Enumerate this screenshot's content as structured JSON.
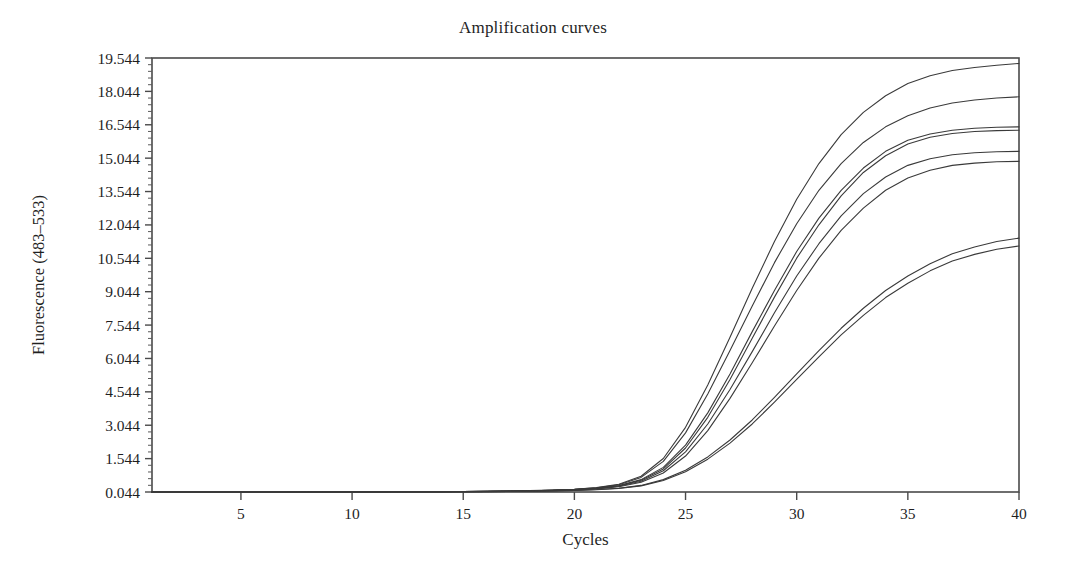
{
  "chart_data": {
    "type": "line",
    "title": "Amplification curves",
    "xlabel": "Cycles",
    "ylabel": "Fluorescence (483–533)",
    "xlim": [
      1,
      40
    ],
    "ylim": [
      0.044,
      19.544
    ],
    "grid": false,
    "legend": null,
    "xticks": [
      5,
      10,
      15,
      20,
      25,
      30,
      35,
      40
    ],
    "xtick_labels": [
      "5",
      "10",
      "15",
      "20",
      "25",
      "30",
      "35",
      "40"
    ],
    "yticks": [
      0.044,
      1.544,
      3.044,
      4.544,
      6.044,
      7.544,
      9.044,
      10.544,
      12.044,
      13.544,
      15.044,
      16.544,
      18.044,
      19.544
    ],
    "ytick_labels": [
      "0.044",
      "1.544",
      "3.044",
      "4.544",
      "6.044",
      "7.544",
      "9.044",
      "10.544",
      "12.044",
      "13.544",
      "15.044",
      "16.544",
      "18.044",
      "19.544"
    ],
    "line_color": "#3a3a3a",
    "x": [
      1,
      2,
      3,
      4,
      5,
      6,
      7,
      8,
      9,
      10,
      11,
      12,
      13,
      14,
      15,
      16,
      17,
      18,
      19,
      20,
      21,
      22,
      23,
      24,
      25,
      26,
      27,
      28,
      29,
      30,
      31,
      32,
      33,
      34,
      35,
      36,
      37,
      38,
      39,
      40
    ],
    "series": [
      {
        "name": "Sample 1",
        "plateau": 19.3,
        "ct": 23.2,
        "values": [
          0.044,
          0.044,
          0.045,
          0.045,
          0.046,
          0.046,
          0.047,
          0.048,
          0.049,
          0.05,
          0.052,
          0.054,
          0.057,
          0.061,
          0.067,
          0.075,
          0.087,
          0.105,
          0.13,
          0.17,
          0.24,
          0.39,
          0.75,
          1.55,
          2.95,
          4.85,
          7.0,
          9.2,
          11.3,
          13.2,
          14.8,
          16.1,
          17.1,
          17.85,
          18.4,
          18.75,
          18.98,
          19.12,
          19.22,
          19.3
        ]
      },
      {
        "name": "Sample 2",
        "plateau": 17.8,
        "ct": 23.4,
        "values": [
          0.044,
          0.044,
          0.045,
          0.045,
          0.046,
          0.046,
          0.047,
          0.048,
          0.049,
          0.05,
          0.052,
          0.054,
          0.057,
          0.06,
          0.065,
          0.073,
          0.084,
          0.1,
          0.124,
          0.162,
          0.228,
          0.37,
          0.7,
          1.42,
          2.7,
          4.45,
          6.4,
          8.4,
          10.35,
          12.1,
          13.6,
          14.8,
          15.75,
          16.45,
          16.95,
          17.3,
          17.52,
          17.66,
          17.75,
          17.8
        ]
      },
      {
        "name": "Sample 3",
        "plateau": 16.45,
        "ct": 24.6,
        "values": [
          0.044,
          0.044,
          0.045,
          0.045,
          0.046,
          0.046,
          0.047,
          0.048,
          0.049,
          0.05,
          0.051,
          0.053,
          0.056,
          0.059,
          0.064,
          0.071,
          0.082,
          0.097,
          0.12,
          0.155,
          0.215,
          0.33,
          0.6,
          1.15,
          2.15,
          3.6,
          5.35,
          7.25,
          9.1,
          10.85,
          12.35,
          13.6,
          14.6,
          15.35,
          15.85,
          16.13,
          16.3,
          16.39,
          16.43,
          16.45
        ]
      },
      {
        "name": "Sample 4",
        "plateau": 16.3,
        "ct": 24.7,
        "values": [
          0.044,
          0.044,
          0.045,
          0.045,
          0.046,
          0.046,
          0.047,
          0.048,
          0.049,
          0.05,
          0.051,
          0.053,
          0.055,
          0.058,
          0.063,
          0.07,
          0.08,
          0.095,
          0.117,
          0.15,
          0.206,
          0.315,
          0.57,
          1.08,
          2.02,
          3.4,
          5.1,
          6.95,
          8.8,
          10.55,
          12.05,
          13.35,
          14.4,
          15.15,
          15.68,
          15.98,
          16.15,
          16.24,
          16.28,
          16.3
        ]
      },
      {
        "name": "Sample 5",
        "plateau": 15.35,
        "ct": 25.0,
        "values": [
          0.044,
          0.044,
          0.045,
          0.045,
          0.046,
          0.046,
          0.047,
          0.048,
          0.049,
          0.05,
          0.051,
          0.053,
          0.055,
          0.058,
          0.062,
          0.069,
          0.079,
          0.093,
          0.113,
          0.145,
          0.198,
          0.3,
          0.53,
          1.0,
          1.85,
          3.1,
          4.65,
          6.35,
          8.1,
          9.75,
          11.2,
          12.45,
          13.45,
          14.2,
          14.72,
          15.02,
          15.2,
          15.29,
          15.33,
          15.35
        ]
      },
      {
        "name": "Sample 6",
        "plateau": 14.9,
        "ct": 25.3,
        "values": [
          0.044,
          0.044,
          0.045,
          0.045,
          0.046,
          0.046,
          0.047,
          0.048,
          0.049,
          0.05,
          0.051,
          0.052,
          0.054,
          0.057,
          0.061,
          0.067,
          0.076,
          0.089,
          0.108,
          0.138,
          0.186,
          0.28,
          0.48,
          0.9,
          1.66,
          2.8,
          4.25,
          5.85,
          7.5,
          9.1,
          10.55,
          11.8,
          12.8,
          13.6,
          14.15,
          14.5,
          14.72,
          14.82,
          14.88,
          14.9
        ]
      },
      {
        "name": "Sample 7",
        "plateau": 11.45,
        "ct": 27.5,
        "values": [
          0.044,
          0.044,
          0.045,
          0.045,
          0.046,
          0.046,
          0.047,
          0.047,
          0.048,
          0.049,
          0.05,
          0.051,
          0.053,
          0.055,
          0.058,
          0.063,
          0.07,
          0.08,
          0.095,
          0.118,
          0.153,
          0.215,
          0.34,
          0.6,
          1.02,
          1.62,
          2.38,
          3.28,
          4.3,
          5.35,
          6.4,
          7.4,
          8.3,
          9.1,
          9.75,
          10.3,
          10.75,
          11.05,
          11.3,
          11.45
        ]
      },
      {
        "name": "Sample 8",
        "plateau": 11.1,
        "ct": 27.7,
        "values": [
          0.044,
          0.044,
          0.045,
          0.045,
          0.046,
          0.046,
          0.047,
          0.047,
          0.048,
          0.049,
          0.05,
          0.051,
          0.052,
          0.054,
          0.057,
          0.062,
          0.069,
          0.078,
          0.092,
          0.113,
          0.146,
          0.205,
          0.32,
          0.56,
          0.95,
          1.52,
          2.24,
          3.1,
          4.08,
          5.1,
          6.12,
          7.1,
          7.98,
          8.78,
          9.42,
          9.98,
          10.42,
          10.72,
          10.95,
          11.1
        ]
      }
    ]
  }
}
